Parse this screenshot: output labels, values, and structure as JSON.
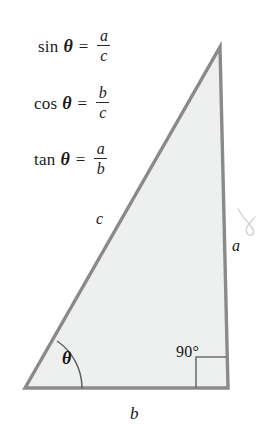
{
  "figure": {
    "background_color": "#ffffff",
    "triangle": {
      "fill_color": "#eef0ef",
      "stroke_color": "#8a8a8a",
      "stroke_width": 3,
      "vertices": {
        "apex": [
          220,
          47
        ],
        "bottom_left": [
          25,
          388
        ],
        "bottom_right": [
          228,
          388
        ]
      }
    }
  },
  "formulas": [
    {
      "function": "sin",
      "angle": "θ",
      "equals": "=",
      "numerator": "a",
      "denominator": "c"
    },
    {
      "function": "cos",
      "angle": "θ",
      "equals": "=",
      "numerator": "b",
      "denominator": "c"
    },
    {
      "function": "tan",
      "angle": "θ",
      "equals": "=",
      "numerator": "a",
      "denominator": "b"
    }
  ],
  "labels": {
    "hypotenuse": "c",
    "opposite": "a",
    "adjacent": "b",
    "angle_theta": "θ",
    "right_angle": "90°"
  },
  "annotations": {
    "handwritten_mark": "b"
  }
}
